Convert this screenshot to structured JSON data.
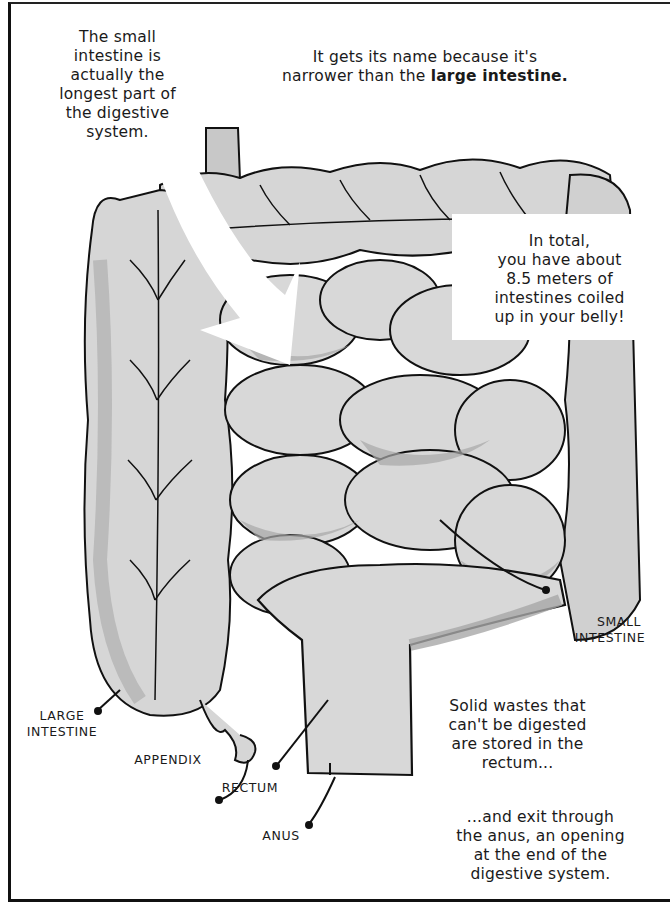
{
  "captions": {
    "small_intestine_longest": [
      "The small",
      "intestine is",
      "actually the",
      "longest part of",
      "the digestive",
      "system."
    ],
    "name_origin": {
      "line1": "It gets its name because it's",
      "line2_prefix": "narrower than the ",
      "line2_bold": "large intestine."
    },
    "total_length": [
      "In total,",
      "you have about",
      "8.5 meters of",
      "intestines coiled",
      "up in your belly!"
    ],
    "rectum_storage": [
      "Solid wastes that",
      "can't be digested",
      "are stored in the",
      "rectum..."
    ],
    "anus_exit": [
      "...and exit through",
      "the anus, an opening",
      "at the end of the",
      "digestive system."
    ]
  },
  "labels": {
    "small_intestine": [
      "SMALL",
      "INTESTINE"
    ],
    "large_intestine": [
      "LARGE",
      "INTESTINE"
    ],
    "appendix": "APPENDIX",
    "rectum": "RECTUM",
    "anus": "ANUS"
  },
  "colors": {
    "organ_light": "#d9d9d9",
    "organ_shadow": "#a8a8a8",
    "outline": "#111111",
    "background": "#ffffff"
  }
}
